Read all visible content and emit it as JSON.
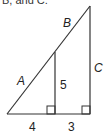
{
  "caption": "B, and C.",
  "diagram": {
    "type": "similar right triangles",
    "labels": {
      "hyp_lower": "A",
      "hyp_upper": "B",
      "right_side": "C",
      "inner_height": "5",
      "base_left": "4",
      "base_right": "3"
    },
    "stroke_color": "#333333"
  }
}
